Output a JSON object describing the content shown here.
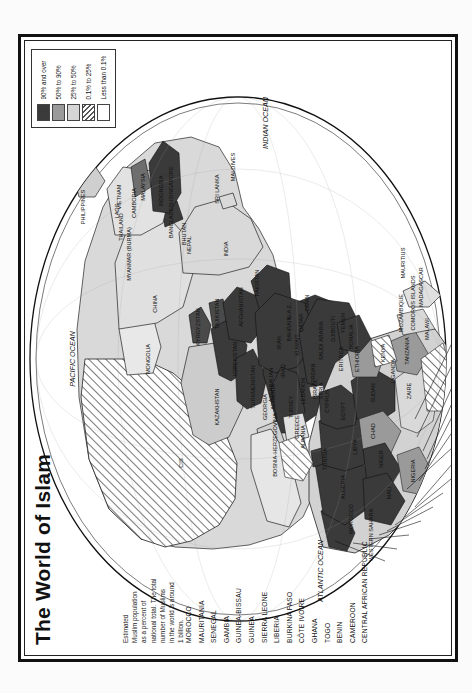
{
  "page": {
    "title": "The World of Islam"
  },
  "note": {
    "lines": [
      "Estimated",
      "Muslim population",
      "as a percent of",
      "national total. The total",
      "number of Muslims",
      "in the world is around",
      "1 billion."
    ]
  },
  "legend": {
    "entries": [
      {
        "label": "90% and over",
        "color": "#3b3b3b",
        "pattern": "solid"
      },
      {
        "label": "50% to 90%",
        "color": "#9a9a9a",
        "pattern": "solid"
      },
      {
        "label": "25% to 50%",
        "color": "#d6d6d6",
        "pattern": "solid"
      },
      {
        "label": "0.1% to 25%",
        "color": "#ffffff",
        "pattern": "hatch"
      },
      {
        "label": "Less than 0.1%",
        "color": "#ffffff",
        "pattern": "none"
      }
    ]
  },
  "leader_labels": [
    "MOROCCO",
    "MAURITANIA",
    "SENEGAL",
    "GAMBIA",
    "GUINEA-BISSAU",
    "GUINEA",
    "SIERRA LEONE",
    "LIBERIA",
    "BURKINA FASO",
    "CÔTE IVOIRE",
    "GHANA",
    "TOGO",
    "BENIN",
    "CAMEROON",
    "CENTRAL AFRICAN REPUBLIC"
  ],
  "map_labels": {
    "oceans": [
      {
        "name": "PACIFIC OCEAN",
        "x": 300,
        "y": 52
      },
      {
        "name": "ATLANTIC OCEAN",
        "x": 88,
        "y": 300
      },
      {
        "name": "INDIAN OCEAN",
        "x": 536,
        "y": 245
      }
    ],
    "countries": [
      {
        "name": "CIS",
        "x": 196,
        "y": 160
      },
      {
        "name": "MONGOLIA",
        "x": 300,
        "y": 127
      },
      {
        "name": "CHINA",
        "x": 355,
        "y": 134
      },
      {
        "name": "KAZAKHSTAN",
        "x": 252,
        "y": 196
      },
      {
        "name": "KYRGYZSTAN",
        "x": 332,
        "y": 177
      },
      {
        "name": "TAJIKISTAN",
        "x": 345,
        "y": 196
      },
      {
        "name": "UZBEKISTAN",
        "x": 300,
        "y": 214
      },
      {
        "name": "TURKMENISTAN",
        "x": 272,
        "y": 232
      },
      {
        "name": "AFGHANISTAN",
        "x": 352,
        "y": 220
      },
      {
        "name": "PAKISTAN",
        "x": 376,
        "y": 236
      },
      {
        "name": "INDIA",
        "x": 410,
        "y": 205
      },
      {
        "name": "NEPAL",
        "x": 414,
        "y": 168
      },
      {
        "name": "BHUTAN",
        "x": 425,
        "y": 163
      },
      {
        "name": "BANGLADESH",
        "x": 440,
        "y": 150
      },
      {
        "name": "MYANMAR (BURMA)",
        "x": 405,
        "y": 108
      },
      {
        "name": "THAILAND",
        "x": 432,
        "y": 100
      },
      {
        "name": "LAOS",
        "x": 448,
        "y": 96
      },
      {
        "name": "VIETNAM",
        "x": 462,
        "y": 98
      },
      {
        "name": "CAMBODIA",
        "x": 456,
        "y": 113
      },
      {
        "name": "MALAYSIA",
        "x": 472,
        "y": 122
      },
      {
        "name": "SINGAPORE",
        "x": 476,
        "y": 150
      },
      {
        "name": "INDONESIA",
        "x": 468,
        "y": 140
      },
      {
        "name": "PHILIPPINES",
        "x": 452,
        "y": 62
      },
      {
        "name": "SRI LANKA",
        "x": 470,
        "y": 196
      },
      {
        "name": "MALDIVES",
        "x": 492,
        "y": 212
      },
      {
        "name": "IRAN",
        "x": 316,
        "y": 258
      },
      {
        "name": "IRAQ",
        "x": 288,
        "y": 262
      },
      {
        "name": "KUWAIT",
        "x": 314,
        "y": 276
      },
      {
        "name": "BAHRAIN",
        "x": 330,
        "y": 268
      },
      {
        "name": "QATAR",
        "x": 336,
        "y": 280
      },
      {
        "name": "U.A.E.",
        "x": 348,
        "y": 268
      },
      {
        "name": "OMAN",
        "x": 356,
        "y": 286
      },
      {
        "name": "SAUDI ARABIA",
        "x": 318,
        "y": 300
      },
      {
        "name": "YEMEN",
        "x": 336,
        "y": 322
      },
      {
        "name": "JORDAN",
        "x": 284,
        "y": 292
      },
      {
        "name": "ISRAEL",
        "x": 270,
        "y": 294
      },
      {
        "name": "LEBANON",
        "x": 268,
        "y": 282
      },
      {
        "name": "SYRIA",
        "x": 268,
        "y": 300
      },
      {
        "name": "CYPRUS",
        "x": 258,
        "y": 306
      },
      {
        "name": "TURKEY",
        "x": 252,
        "y": 270
      },
      {
        "name": "AZERBAIJAN",
        "x": 274,
        "y": 250
      },
      {
        "name": "ARMENIA",
        "x": 262,
        "y": 252
      },
      {
        "name": "GEORGIA",
        "x": 252,
        "y": 244
      },
      {
        "name": "GREECE",
        "x": 232,
        "y": 276
      },
      {
        "name": "ALBANIA",
        "x": 222,
        "y": 282
      },
      {
        "name": "BOSNIA-HERZEGOVINA",
        "x": 214,
        "y": 254
      },
      {
        "name": "EGYPT",
        "x": 248,
        "y": 322
      },
      {
        "name": "LIBYA",
        "x": 212,
        "y": 334
      },
      {
        "name": "TUNISIA",
        "x": 200,
        "y": 304
      },
      {
        "name": "ALGERIA",
        "x": 172,
        "y": 322
      },
      {
        "name": "MOROCCO",
        "x": 140,
        "y": 330
      },
      {
        "name": "WESTERN SAHARA",
        "x": 124,
        "y": 350
      },
      {
        "name": "MALI",
        "x": 166,
        "y": 368
      },
      {
        "name": "NIGER",
        "x": 200,
        "y": 360
      },
      {
        "name": "CHAD",
        "x": 228,
        "y": 352
      },
      {
        "name": "SUDAN",
        "x": 266,
        "y": 352
      },
      {
        "name": "NIGERIA",
        "x": 188,
        "y": 392
      },
      {
        "name": "ETHIOPIA",
        "x": 300,
        "y": 336
      },
      {
        "name": "SOMALIA",
        "x": 322,
        "y": 330
      },
      {
        "name": "DJIBOUTI",
        "x": 330,
        "y": 312
      },
      {
        "name": "ERITREA",
        "x": 300,
        "y": 320
      },
      {
        "name": "UGANDA",
        "x": 288,
        "y": 372
      },
      {
        "name": "KENYA",
        "x": 306,
        "y": 362
      },
      {
        "name": "TANZANIA",
        "x": 308,
        "y": 386
      },
      {
        "name": "ZAIRE",
        "x": 268,
        "y": 388
      },
      {
        "name": "MALAWI",
        "x": 330,
        "y": 406
      },
      {
        "name": "MOZAMBIQUE",
        "x": 346,
        "y": 380
      },
      {
        "name": "COMOROS ISLANDS",
        "x": 356,
        "y": 392
      },
      {
        "name": "MADAGASCAR",
        "x": 372,
        "y": 400
      },
      {
        "name": "MAURITIUS",
        "x": 396,
        "y": 382
      }
    ]
  }
}
